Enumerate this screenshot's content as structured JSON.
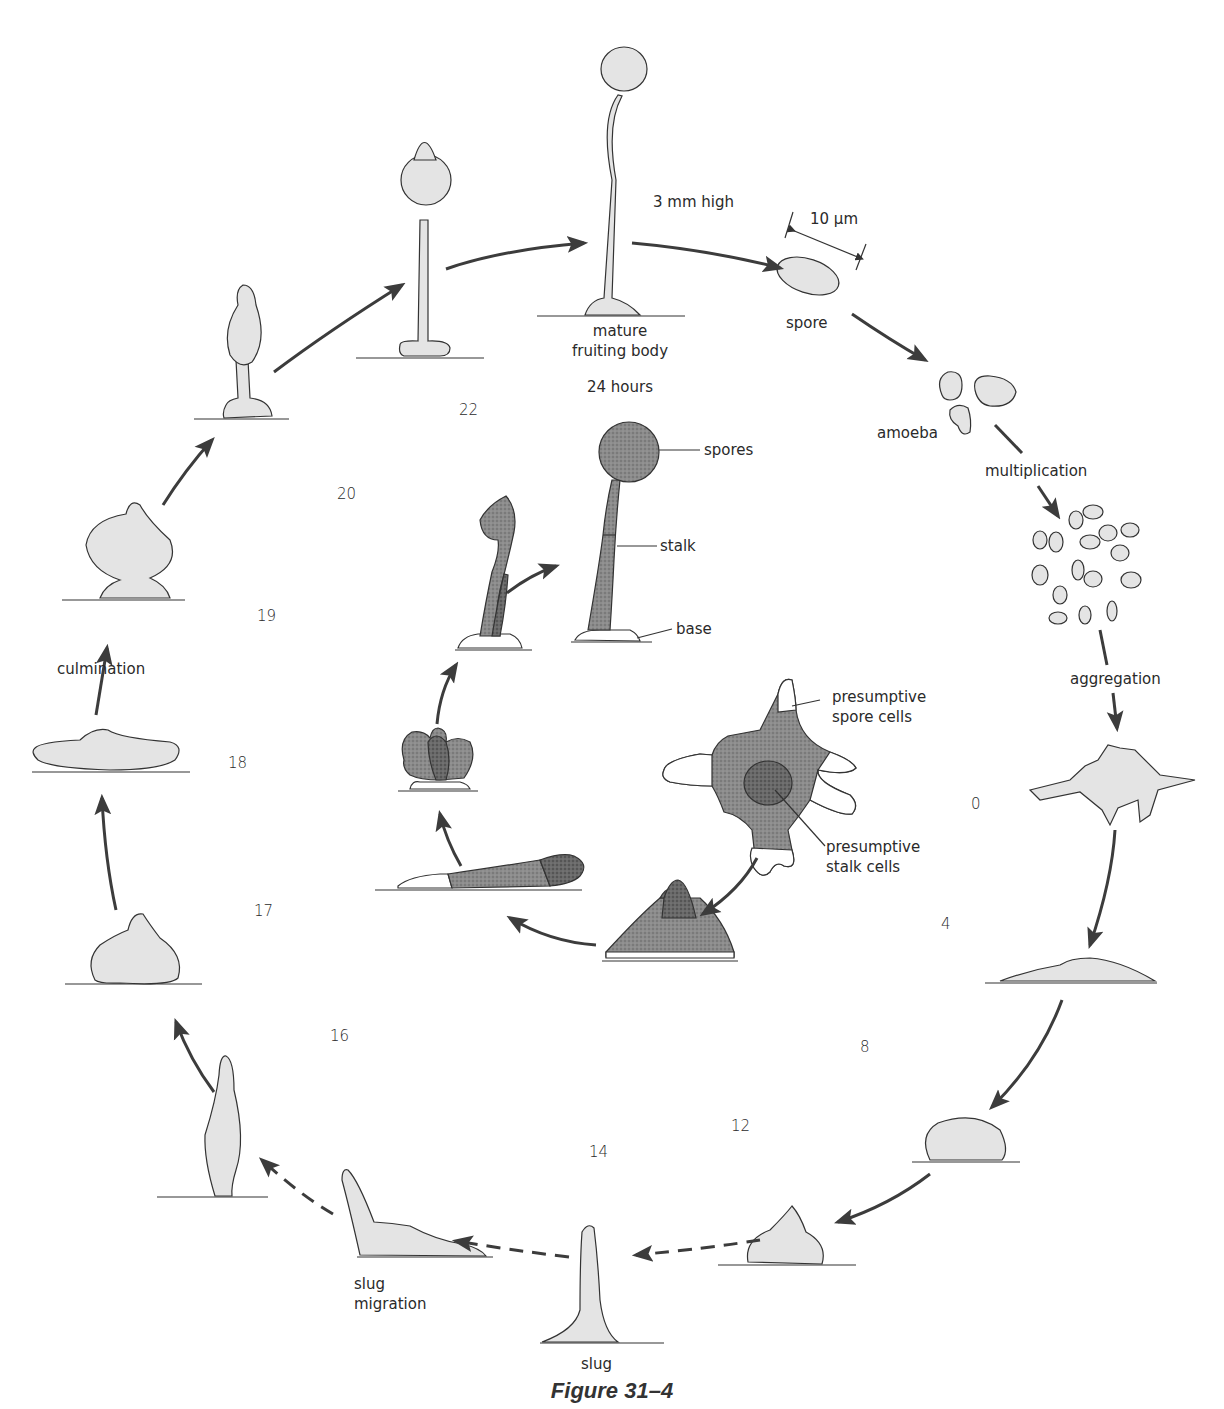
{
  "figure": {
    "caption": "Figure 31–4"
  },
  "labels": {
    "height": "3 mm high",
    "scale": "10 μm",
    "spore": "spore",
    "mature_line1": "mature",
    "mature_line2": "fruiting body",
    "time_24": "24 hours",
    "amoeba": "amoeba",
    "multiplication": "multiplication",
    "aggregation": "aggregation",
    "culmination": "culmination",
    "slug": "slug",
    "slug_migration_line1": "slug",
    "slug_migration_line2": "migration"
  },
  "inner_labels": {
    "spores": "spores",
    "stalk": "stalk",
    "base": "base",
    "presumptive_spore_line1": "presumptive",
    "presumptive_spore_line2": "spore cells",
    "presumptive_stalk_line1": "presumptive",
    "presumptive_stalk_line2": "stalk cells"
  },
  "hours": [
    "0",
    "4",
    "8",
    "12",
    "14",
    "16",
    "17",
    "18",
    "19",
    "20",
    "22"
  ],
  "colors": {
    "fill_light": "#e4e4e4",
    "fill_dark": "#8c8c8c",
    "fill_darker": "#6a6a6a",
    "arrow": "#3c3c3c",
    "ink": "#222222"
  }
}
